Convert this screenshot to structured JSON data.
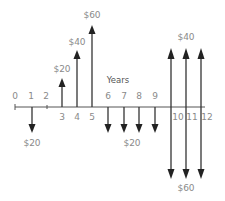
{
  "diagram": {
    "type": "cash-flow-diagram",
    "axis_label": "Years",
    "colors": {
      "arrow": "#333333",
      "label": "#8a8a8a",
      "axis": "#555555"
    },
    "years": [
      "0",
      "1",
      "2",
      "3",
      "4",
      "5",
      "6",
      "7",
      "8",
      "9",
      "10",
      "11",
      "12"
    ],
    "cash_flows": [
      {
        "year": 1,
        "direction": "down",
        "amount": "$20"
      },
      {
        "year": 3,
        "direction": "up",
        "amount": "$20"
      },
      {
        "year": 4,
        "direction": "up",
        "amount": "$40"
      },
      {
        "year": 5,
        "direction": "up",
        "amount": "$60"
      },
      {
        "year": 6,
        "direction": "down",
        "amount": "$20"
      },
      {
        "year": 7,
        "direction": "down",
        "amount": "$20"
      },
      {
        "year": 8,
        "direction": "down",
        "amount": "$20"
      },
      {
        "year": 9,
        "direction": "down",
        "amount": "$20"
      },
      {
        "year": 10,
        "direction": "up",
        "amount": "$40"
      },
      {
        "year": 11,
        "direction": "up",
        "amount": "$40"
      },
      {
        "year": 12,
        "direction": "up",
        "amount": "$40"
      },
      {
        "year": 10,
        "direction": "down",
        "amount": "$60"
      },
      {
        "year": 11,
        "direction": "down",
        "amount": "$60"
      },
      {
        "year": 12,
        "direction": "down",
        "amount": "$60"
      }
    ],
    "amount_labels": {
      "y1_down": "$20",
      "y3_up": "$20",
      "y4_up": "$40",
      "y5_up": "$60",
      "y6_9_down": "$20",
      "y10_12_up": "$40",
      "y10_12_down": "$60"
    }
  }
}
